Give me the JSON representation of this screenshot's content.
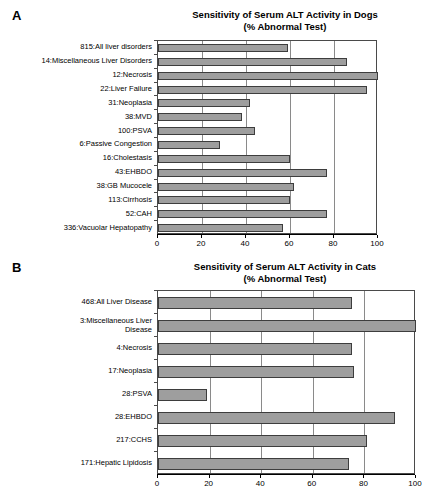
{
  "figure": {
    "panels": [
      {
        "letter": "A",
        "title_line1": "Sensitivity of Serum ALT Activity in Dogs",
        "title_line2": "(% Abnormal Test)"
      },
      {
        "letter": "B",
        "title_line1": "Sensitivity of Serum ALT Activity in Cats",
        "title_line2": "(% Abnormal Test)"
      }
    ]
  },
  "chart_data": [
    {
      "type": "bar",
      "orientation": "horizontal",
      "panel": "A",
      "title": "Sensitivity of Serum ALT Activity in Dogs (% Abnormal Test)",
      "xlabel": "",
      "ylabel": "",
      "xlim": [
        0,
        100
      ],
      "xticks": [
        0,
        20,
        40,
        60,
        80,
        100
      ],
      "grid": true,
      "legend": "none",
      "bar_color": "#9e9e9e",
      "categories": [
        "815:All liver disorders",
        "14:Miscellaneous Liver Disorders",
        "12:Necrosis",
        "22:Liver Failure",
        "31:Neoplasia",
        "38:MVD",
        "100:PSVA",
        "6:Passive Congestion",
        "16:Cholestasis",
        "43:EHBDO",
        "38:GB Mucocele",
        "113:Cirrhosis",
        "52:CAH",
        "336:Vacuolar Hepatopathy"
      ],
      "values": [
        59,
        86,
        100,
        95,
        42,
        38,
        44,
        28,
        60,
        77,
        62,
        60,
        77,
        57
      ]
    },
    {
      "type": "bar",
      "orientation": "horizontal",
      "panel": "B",
      "title": "Sensitivity of Serum ALT Activity in Cats (% Abnormal Test)",
      "xlabel": "",
      "ylabel": "",
      "xlim": [
        0,
        100
      ],
      "xticks": [
        0,
        20,
        40,
        60,
        80,
        100
      ],
      "grid": true,
      "legend": "none",
      "bar_color": "#9e9e9e",
      "categories": [
        "468:All Liver Disease",
        "3:Miscellaneous Liver\nDisease",
        "4:Necrosis",
        "17:Neoplasia",
        "28:PSVA",
        "28:EHBDO",
        "217:CCHS",
        "171:Hepatic Lipidosis"
      ],
      "values": [
        75,
        100,
        75,
        76,
        19,
        92,
        81,
        74
      ]
    }
  ]
}
